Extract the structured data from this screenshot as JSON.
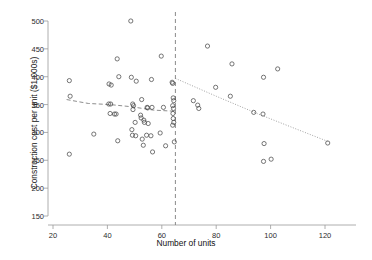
{
  "chart_data": {
    "type": "scatter",
    "title": "",
    "xlabel": "Number of units",
    "ylabel": "Construction cost per unit ($1,000s)",
    "xlim": [
      20,
      130
    ],
    "ylim": [
      150,
      505
    ],
    "xticks": [
      20,
      40,
      60,
      80,
      100,
      120
    ],
    "yticks": [
      150,
      200,
      250,
      300,
      350,
      400,
      450,
      500
    ],
    "grid": false,
    "legend": null,
    "marker": "open-circle",
    "annotations": [
      {
        "name": "cutoff-line",
        "type": "vertical-dashed-line",
        "x": 65,
        "label": ""
      }
    ],
    "series": [
      {
        "name": "projects",
        "points": [
          [
            26.0,
            393
          ],
          [
            26.3,
            365
          ],
          [
            26.0,
            261
          ],
          [
            35.0,
            297
          ],
          [
            40.5,
            351
          ],
          [
            41.2,
            351
          ],
          [
            40.6,
            387
          ],
          [
            41.4,
            385
          ],
          [
            41.0,
            334
          ],
          [
            42.6,
            333
          ],
          [
            43.2,
            333
          ],
          [
            43.6,
            432
          ],
          [
            43.8,
            285
          ],
          [
            44.2,
            400
          ],
          [
            48.6,
            500
          ],
          [
            48.8,
            399
          ],
          [
            49.3,
            351
          ],
          [
            49.6,
            348
          ],
          [
            49.4,
            341
          ],
          [
            49.0,
            305
          ],
          [
            49.2,
            295
          ],
          [
            50.6,
            392
          ],
          [
            50.2,
            318
          ],
          [
            50.4,
            294
          ],
          [
            52.6,
            359
          ],
          [
            52.2,
            331
          ],
          [
            52.4,
            326
          ],
          [
            52.8,
            288
          ],
          [
            53.4,
            322
          ],
          [
            53.6,
            318
          ],
          [
            53.2,
            277
          ],
          [
            54.6,
            345
          ],
          [
            54.8,
            344
          ],
          [
            55.0,
            316
          ],
          [
            54.4,
            295
          ],
          [
            56.2,
            395
          ],
          [
            56.4,
            345
          ],
          [
            56.0,
            294
          ],
          [
            56.6,
            265
          ],
          [
            59.8,
            437
          ],
          [
            59.4,
            299
          ],
          [
            60.6,
            345
          ],
          [
            61.4,
            276
          ],
          [
            63.8,
            390
          ],
          [
            64.0,
            388
          ],
          [
            64.2,
            362
          ],
          [
            64.4,
            357
          ],
          [
            64.0,
            348
          ],
          [
            64.3,
            343
          ],
          [
            64.1,
            334
          ],
          [
            64.2,
            325
          ],
          [
            64.4,
            318
          ],
          [
            64.0,
            313
          ],
          [
            64.6,
            283
          ],
          [
            71.6,
            357
          ],
          [
            73.2,
            349
          ],
          [
            73.6,
            343
          ],
          [
            76.8,
            455
          ],
          [
            79.8,
            381
          ],
          [
            85.2,
            365
          ],
          [
            85.8,
            423
          ],
          [
            93.8,
            336
          ],
          [
            97.4,
            399
          ],
          [
            97.2,
            333
          ],
          [
            97.6,
            280
          ],
          [
            97.4,
            248
          ],
          [
            100.2,
            252
          ],
          [
            102.6,
            414
          ],
          [
            121.0,
            281
          ]
        ]
      }
    ],
    "fit_lines": [
      {
        "name": "left-segment-fit",
        "style": "dashed",
        "points": [
          [
            25.0,
            359
          ],
          [
            33.0,
            352
          ],
          [
            41.0,
            350
          ],
          [
            49.0,
            346
          ],
          [
            57.0,
            340
          ],
          [
            65.0,
            338
          ]
        ]
      },
      {
        "name": "right-segment-fit",
        "style": "dotted",
        "points": [
          [
            65.0,
            397
          ],
          [
            80.0,
            365
          ],
          [
            95.0,
            334
          ],
          [
            110.0,
            305
          ],
          [
            121.5,
            283
          ]
        ]
      }
    ]
  },
  "axes": {
    "x_tick_labels": [
      "20",
      "40",
      "60",
      "80",
      "100",
      "120"
    ],
    "y_tick_labels": [
      "150",
      "200",
      "250",
      "300",
      "350",
      "400",
      "450",
      "500"
    ],
    "x_axis_title": "Number of units",
    "y_axis_title": "Construction cost per unit ($1,000s)"
  },
  "colors": {
    "marker_stroke": "#4a4a4a",
    "axis": "#9a9a9a",
    "cutoff_line": "#7d7d7d",
    "fit_line": "#808080",
    "background": "#ffffff",
    "text": "#1a1a1a"
  }
}
